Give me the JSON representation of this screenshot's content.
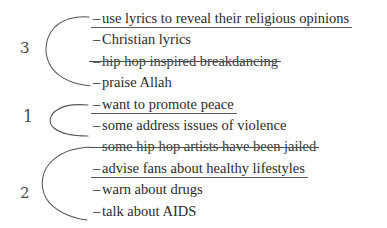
{
  "document": {
    "kind": "annotated-list",
    "background_color": "#ffffff",
    "ink_color": "#2b2b2b",
    "annotation_color": "#565656"
  },
  "margin_numbers": [
    {
      "label": "3",
      "name": "margin-number-three"
    },
    {
      "label": "1",
      "name": "margin-number-one"
    },
    {
      "label": "2",
      "name": "margin-number-two"
    }
  ],
  "list": {
    "dash": "–",
    "items": [
      {
        "text": "use lyrics to reveal their religious opinions",
        "underlined": true,
        "struck": false
      },
      {
        "text": "Christian lyrics",
        "underlined": false,
        "struck": false
      },
      {
        "text": "hip hop inspired breakdancing",
        "underlined": false,
        "struck": true
      },
      {
        "text": "praise Allah",
        "underlined": false,
        "struck": false
      },
      {
        "text": "want to promote peace",
        "underlined": true,
        "struck": false
      },
      {
        "text": "some address issues of violence",
        "underlined": false,
        "struck": false
      },
      {
        "text": "some hip hop artists have been jailed",
        "underlined": false,
        "struck": true
      },
      {
        "text": "advise fans about healthy lifestyles",
        "underlined": true,
        "struck": false
      },
      {
        "text": "warn about drugs",
        "underlined": false,
        "struck": false
      },
      {
        "text": "talk about AIDS",
        "underlined": false,
        "struck": false
      }
    ]
  },
  "braces": [
    {
      "name": "brace-group-three",
      "number": "3",
      "spans_items": 4,
      "first_item_index": 0
    },
    {
      "name": "brace-group-one",
      "number": "1",
      "spans_items": 2,
      "first_item_index": 4
    },
    {
      "name": "brace-group-two",
      "number": "2",
      "spans_items": 4,
      "first_item_index": 6
    }
  ]
}
